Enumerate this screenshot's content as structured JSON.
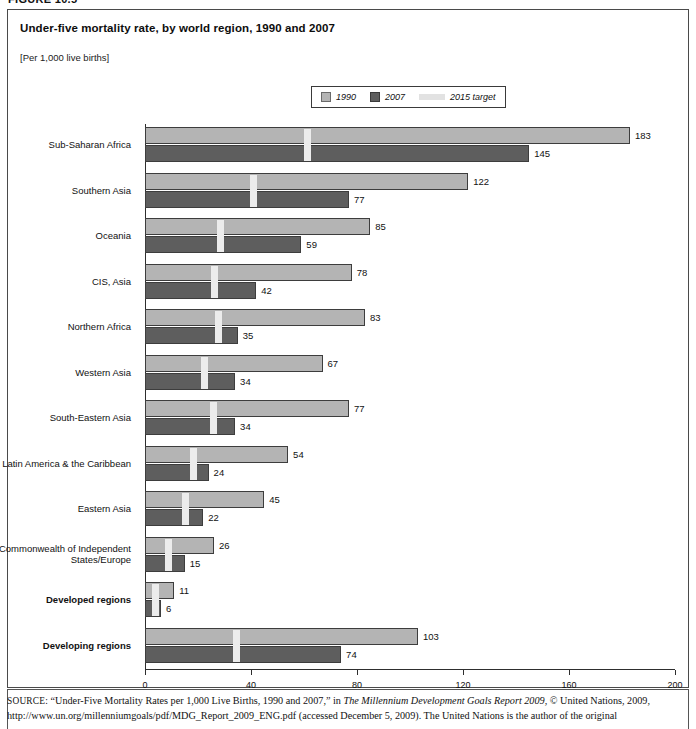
{
  "figure_label": "FIGURE 10.5",
  "chart_title": "Under-five mortality rate, by world region, 1990 and 2007",
  "chart_units": "[Per 1,000 live births]",
  "legend": {
    "items": [
      {
        "label": "1990",
        "swatch": "square-light-gray",
        "color": "#b4b4b4"
      },
      {
        "label": "2007",
        "swatch": "square-dark-gray",
        "color": "#5e5e5e"
      },
      {
        "label": "2015 target",
        "swatch": "bar-very-light-gray",
        "color": "#ececec"
      }
    ]
  },
  "source": {
    "prefix": "SOURCE:",
    "line1_a": " “Under-Five Mortality Rates per 1,000 Live Births, 1990 and 2007,” in ",
    "line1_italic": "The Millennium Development Goals Report 2009",
    "line1_b": ", © United Nations, 2009,",
    "line2": "http://www.un.org/millenniumgoals/pdf/MDG_Report_2009_ENG.pdf (accessed December 5, 2009). The United Nations is the author of the original"
  },
  "chart_data": {
    "type": "bar",
    "orientation": "horizontal",
    "title": "Under-five mortality rate, by world region, 1990 and 2007",
    "subtitle": "[Per 1,000 live births]",
    "xlabel": "",
    "ylabel": "",
    "xlim": [
      0,
      200
    ],
    "xticks": [
      0,
      40,
      80,
      120,
      160,
      200
    ],
    "grid": false,
    "legend_position": "top-center",
    "categories": [
      "Sub-Saharan Africa",
      "Southern Asia",
      "Oceania",
      "CIS, Asia",
      "Northern Africa",
      "Western Asia",
      "South-Eastern Asia",
      "Latin America & the Caribbean",
      "Eastern Asia",
      "Commonwealth of Independent States/Europe",
      "Developed regions",
      "Developing regions"
    ],
    "bold_categories": [
      "Developed regions",
      "Developing regions"
    ],
    "series": [
      {
        "name": "1990",
        "color": "#b4b4b4",
        "values": [
          183,
          122,
          85,
          78,
          83,
          67,
          77,
          54,
          45,
          26,
          11,
          103
        ]
      },
      {
        "name": "2007",
        "color": "#5e5e5e",
        "values": [
          145,
          77,
          59,
          42,
          35,
          34,
          34,
          24,
          22,
          15,
          6,
          74
        ]
      },
      {
        "name": "2015 target",
        "color": "#ececec",
        "marker": "vertical-tick",
        "values": [
          61,
          40.7,
          28.3,
          26,
          27.7,
          22.3,
          25.7,
          18,
          15,
          8.7,
          3.7,
          34.3
        ]
      }
    ]
  }
}
